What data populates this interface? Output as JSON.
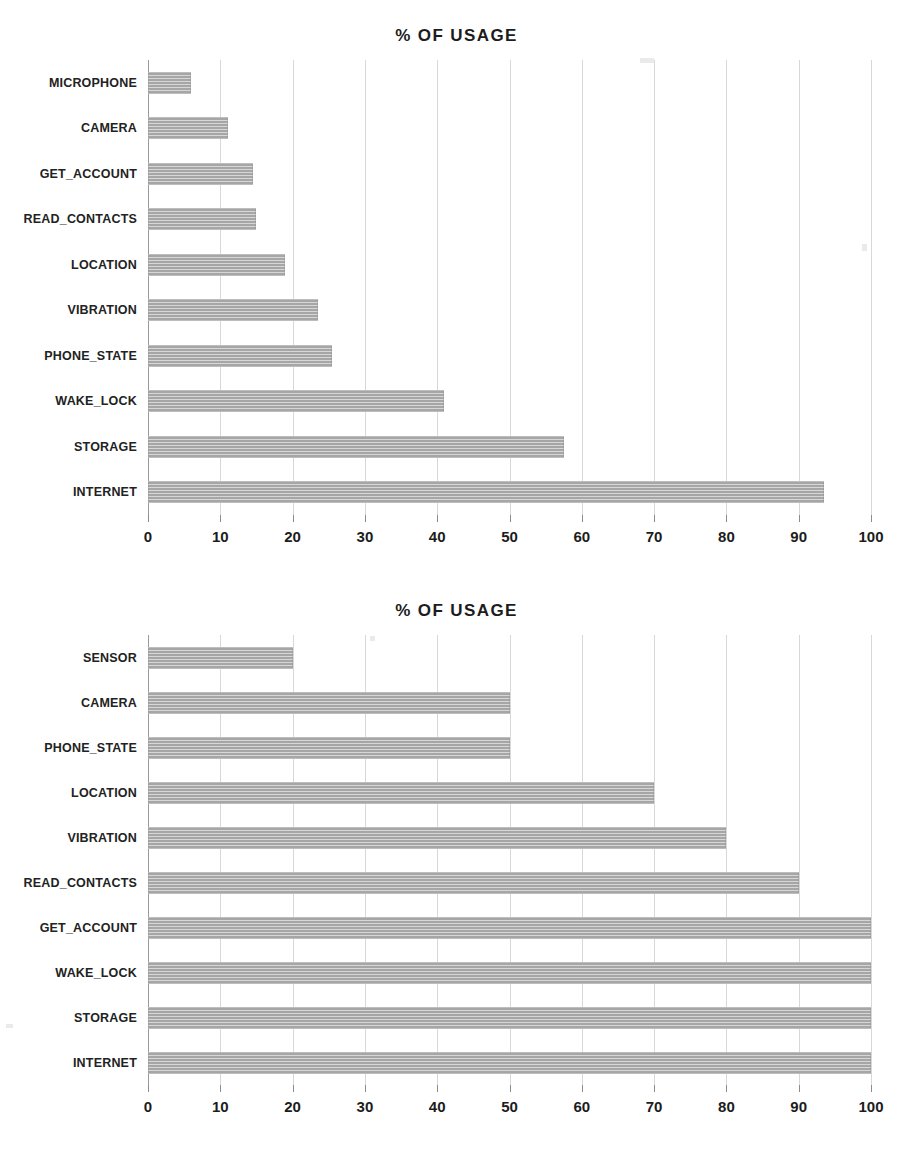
{
  "page": {
    "background_color": "#ffffff",
    "bar_color": "#a6a6a6",
    "grid_color": "#d8d8d8",
    "axis_color": "#9a9a9a",
    "text_color": "#1c1c1c"
  },
  "charts": [
    {
      "title": "% OF USAGE",
      "axis_tick_labels": [
        "0",
        "10",
        "20",
        "30",
        "40",
        "50",
        "60",
        "70",
        "80",
        "90",
        "100"
      ]
    },
    {
      "title": "% OF USAGE",
      "axis_tick_labels": [
        "0",
        "10",
        "20",
        "30",
        "40",
        "50",
        "60",
        "70",
        "80",
        "90",
        "100"
      ]
    }
  ],
  "chart_data": [
    {
      "type": "bar",
      "orientation": "horizontal",
      "title": "% OF USAGE",
      "xlabel": "",
      "ylabel": "",
      "xlim": [
        0,
        100
      ],
      "grid": true,
      "legend": false,
      "categories": [
        "MICROPHONE",
        "CAMERA",
        "GET_ACCOUNT",
        "READ_CONTACTS",
        "LOCATION",
        "VIBRATION",
        "PHONE_STATE",
        "WAKE_LOCK",
        "STORAGE",
        "INTERNET"
      ],
      "values": [
        6,
        11,
        14.5,
        15,
        19,
        23.5,
        25.5,
        41,
        57.5,
        93.5
      ],
      "tick_values": [
        0,
        10,
        20,
        30,
        40,
        50,
        60,
        70,
        80,
        90,
        100
      ],
      "tick_labels": [
        "0",
        "10",
        "20",
        "30",
        "40",
        "50",
        "60",
        "70",
        "80",
        "90",
        "100"
      ]
    },
    {
      "type": "bar",
      "orientation": "horizontal",
      "title": "% OF USAGE",
      "xlabel": "",
      "ylabel": "",
      "xlim": [
        0,
        100
      ],
      "grid": true,
      "legend": false,
      "categories": [
        "SENSOR",
        "CAMERA",
        "PHONE_STATE",
        "LOCATION",
        "VIBRATION",
        "READ_CONTACTS",
        "GET_ACCOUNT",
        "WAKE_LOCK",
        "STORAGE",
        "INTERNET"
      ],
      "values": [
        20,
        50,
        50,
        70,
        80,
        90,
        100,
        100,
        100,
        100
      ],
      "tick_values": [
        0,
        10,
        20,
        30,
        40,
        50,
        60,
        70,
        80,
        90,
        100
      ],
      "tick_labels": [
        "0",
        "10",
        "20",
        "30",
        "40",
        "50",
        "60",
        "70",
        "80",
        "90",
        "100"
      ]
    }
  ]
}
